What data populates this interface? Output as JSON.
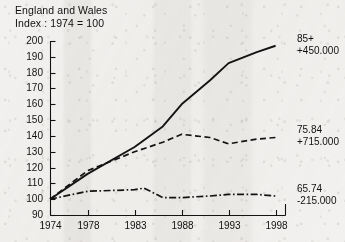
{
  "header": {
    "title": "England and Wales",
    "subtitle": "Index : 1974 = 100"
  },
  "chart_data": {
    "type": "line",
    "title": "England and Wales",
    "subtitle": "Index : 1974 = 100",
    "xlabel": "",
    "ylabel": "",
    "xlim": [
      1974,
      1999
    ],
    "ylim": [
      90,
      200
    ],
    "grid": false,
    "legend_position": "right-inline",
    "x_ticks": [
      "1974",
      "1978",
      "1983",
      "1988",
      "1993",
      "1998"
    ],
    "x_tick_values": [
      1974,
      1978,
      1983,
      1988,
      1993,
      1998
    ],
    "y_ticks": [
      "90",
      "100",
      "110",
      "120",
      "130",
      "140",
      "150",
      "160",
      "170",
      "180",
      "190",
      "200"
    ],
    "y_tick_values": [
      90,
      100,
      110,
      120,
      130,
      140,
      150,
      160,
      170,
      180,
      190,
      200
    ],
    "series": [
      {
        "name": "85+",
        "label": "85+",
        "change_label": "+450.000",
        "style": "solid",
        "color": "#141414",
        "x": [
          1974,
          1978,
          1983,
          1986,
          1988,
          1991,
          1993,
          1996,
          1998
        ],
        "values": [
          100,
          116,
          133,
          146,
          160,
          175,
          186,
          193,
          197
        ]
      },
      {
        "name": "75.84",
        "label": "75.84",
        "change_label": "+715.000",
        "style": "dashed",
        "color": "#141414",
        "x": [
          1974,
          1978,
          1983,
          1986,
          1988,
          1991,
          1993,
          1996,
          1998
        ],
        "values": [
          100,
          118,
          130,
          136,
          141,
          139,
          135,
          138,
          139
        ]
      },
      {
        "name": "65.74",
        "label": "65.74",
        "change_label": "-215.000",
        "style": "dash-dot",
        "color": "#141414",
        "x": [
          1974,
          1978,
          1983,
          1984,
          1986,
          1988,
          1991,
          1993,
          1996,
          1998
        ],
        "values": [
          100,
          105,
          106,
          107,
          101,
          101,
          102,
          103,
          103,
          102
        ]
      }
    ]
  }
}
